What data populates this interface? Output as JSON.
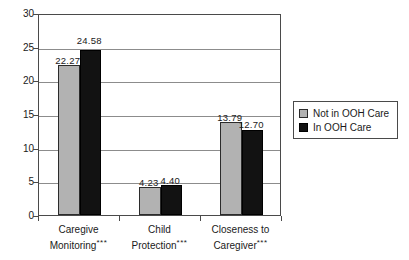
{
  "chart_data": {
    "type": "bar",
    "title": "",
    "subtitle": "",
    "xlabel": "",
    "ylabel": "",
    "ylim": [
      0,
      30
    ],
    "ytick_step": 5,
    "yticks": [
      "0",
      "5",
      "10",
      "15",
      "20",
      "25",
      "30"
    ],
    "grid": true,
    "grid_axis": "y",
    "legend_position": "right",
    "categories": [
      "Caregive Monitoring",
      "Child Protection",
      "Closeness to Caregiver"
    ],
    "category_lines": [
      [
        "Caregive",
        "Monitoring"
      ],
      [
        "Child",
        "Protection"
      ],
      [
        "Closeness to",
        "Caregiver"
      ]
    ],
    "category_significance": [
      "***",
      "***",
      "***"
    ],
    "series": [
      {
        "name": "Not in OOH Care",
        "color": "#b2b2b2",
        "values": [
          22.27,
          4.23,
          13.79
        ],
        "labels": [
          "22.27",
          "4.23",
          "13.79"
        ]
      },
      {
        "name": "In OOH Care",
        "color": "#121212",
        "values": [
          24.58,
          4.4,
          12.7
        ],
        "labels": [
          "24.58",
          "4.40",
          "12.70"
        ]
      }
    ]
  },
  "legend": {
    "items": [
      {
        "label": "Not in OOH Care",
        "swatch": "legend-swatch-gray"
      },
      {
        "label": "In OOH Care",
        "swatch": "legend-swatch-black"
      }
    ]
  }
}
